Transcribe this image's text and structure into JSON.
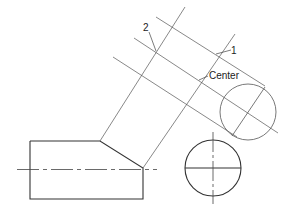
{
  "labels": {
    "label_2": "2",
    "label_1": "1",
    "label_center": "Center"
  },
  "colors": {
    "stroke": "#333333",
    "thin": "#555555"
  }
}
